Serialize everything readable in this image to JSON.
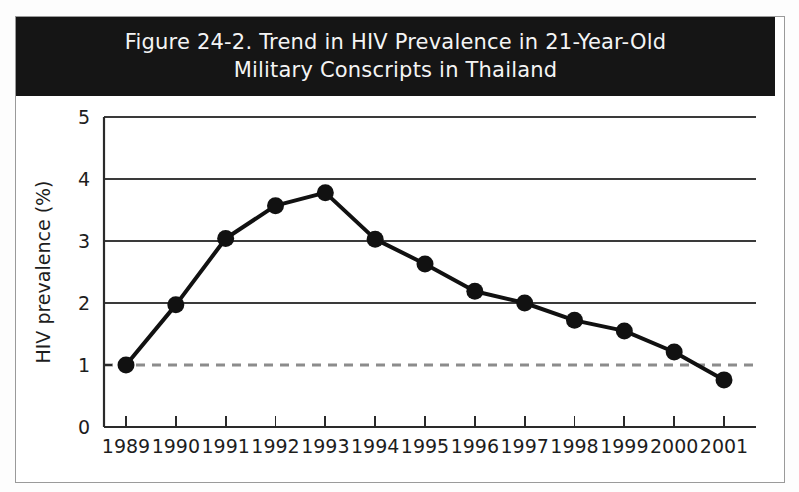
{
  "figure": {
    "title_line1": "Figure 24-2. Trend in HIV Prevalence in 21-Year-Old",
    "title_line2": "Military Conscripts in Thailand",
    "title_full": "Figure 24-2. Trend in HIV Prevalence in 21-Year-Old\nMilitary Conscripts in Thailand",
    "title_bar_color": "#151515",
    "title_text_color": "#f4f4f4",
    "background_color": "#ffffff",
    "frame_color": "#9a9a9a"
  },
  "chart_data": {
    "type": "line",
    "title": "Figure 24-2. Trend in HIV Prevalence in 21-Year-Old Military Conscripts in Thailand",
    "xlabel": "",
    "ylabel": "HIV prevalence (%)",
    "categories": [
      "1989",
      "1990",
      "1991",
      "1992",
      "1993",
      "1994",
      "1995",
      "1996",
      "1997",
      "1998",
      "1999",
      "2000",
      "2001"
    ],
    "values": [
      1.0,
      1.97,
      3.04,
      3.57,
      3.78,
      3.03,
      2.63,
      2.19,
      2.0,
      1.72,
      1.55,
      1.21,
      0.76
    ],
    "series": [
      {
        "name": "HIV prevalence",
        "values": [
          1.0,
          1.97,
          3.04,
          3.57,
          3.78,
          3.03,
          2.63,
          2.19,
          2.0,
          1.72,
          1.55,
          1.21,
          0.76
        ],
        "color": "#111111",
        "marker": "circle"
      }
    ],
    "ylim": [
      0,
      5
    ],
    "yticks": [
      0,
      1,
      2,
      3,
      4,
      5
    ],
    "ytick_labels": [
      "0",
      "1",
      "2",
      "3",
      "4",
      "5"
    ],
    "xtick_labels": [
      "1989",
      "1990",
      "1991",
      "1992",
      "1993",
      "1994",
      "1995",
      "1996",
      "1997",
      "1998",
      "1999",
      "2000",
      "2001"
    ],
    "grid": "horizontal",
    "gridlines_at": [
      2,
      3,
      4,
      5
    ],
    "reference_line": {
      "value": 1,
      "style": "dashed",
      "color": "#8c8c8c"
    },
    "legend": null,
    "legend_position": "none",
    "annotations": []
  }
}
